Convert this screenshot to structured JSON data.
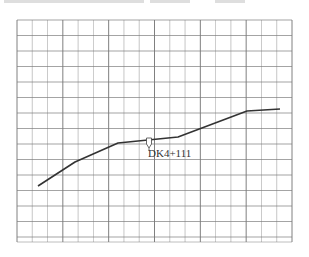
{
  "figure": {
    "type": "profile-line-on-grid",
    "annotation": {
      "label": "DK4+111",
      "marker": "pin"
    },
    "grid": {
      "columns": 18,
      "rows": 14,
      "left": 17,
      "top": 20,
      "right": 292,
      "bottom": 237
    },
    "polyline": [
      [
        38,
        186
      ],
      [
        75,
        162
      ],
      [
        118,
        143
      ],
      [
        148,
        140
      ],
      [
        178,
        137
      ],
      [
        247,
        111
      ],
      [
        280,
        109
      ]
    ],
    "colors": {
      "grid": "#7a7a7a",
      "line": "#333333",
      "background": "#ffffff"
    }
  }
}
